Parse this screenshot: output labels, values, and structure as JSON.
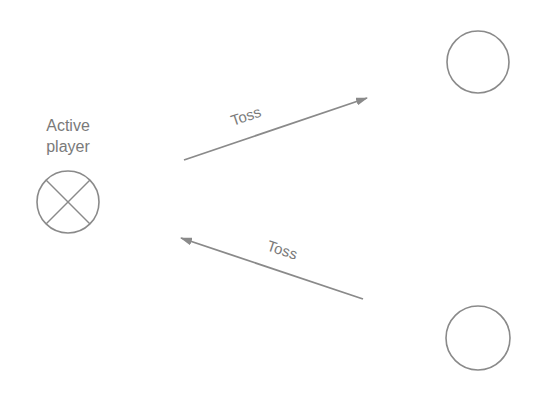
{
  "diagram": {
    "active_player_label_line1": "Active",
    "active_player_label_line2": "player",
    "arrows": [
      {
        "label": "Toss",
        "direction": "to-top-right-player"
      },
      {
        "label": "Toss",
        "direction": "from-bottom-right-player"
      }
    ],
    "nodes": [
      {
        "name": "active-player",
        "icon": "crossed-circle-icon"
      },
      {
        "name": "top-right-player",
        "icon": "circle-icon"
      },
      {
        "name": "bottom-right-player",
        "icon": "circle-icon"
      }
    ],
    "colors": {
      "stroke": "#8a8a8a",
      "text": "#7a7a7a",
      "background": "#ffffff"
    }
  }
}
